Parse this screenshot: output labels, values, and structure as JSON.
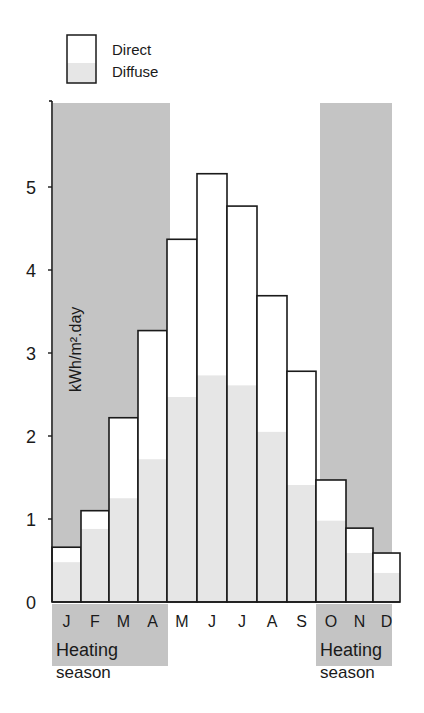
{
  "chart_data": {
    "type": "bar",
    "stacked": true,
    "title": "",
    "xlabel": "",
    "ylabel": "kWh/m².day",
    "ylim": [
      0,
      6
    ],
    "yticks": [
      0,
      1,
      2,
      3,
      4,
      5
    ],
    "grid": false,
    "legend_position": "top-left",
    "categories": [
      "J",
      "F",
      "M",
      "A",
      "M",
      "J",
      "J",
      "A",
      "S",
      "O",
      "N",
      "D"
    ],
    "series": [
      {
        "name": "Diffuse",
        "values": [
          0.48,
          0.88,
          1.25,
          1.72,
          2.47,
          2.73,
          2.61,
          2.05,
          1.41,
          0.98,
          0.59,
          0.35
        ]
      },
      {
        "name": "Direct",
        "values": [
          0.18,
          0.22,
          0.97,
          1.55,
          1.9,
          2.43,
          2.16,
          1.64,
          1.37,
          0.49,
          0.3,
          0.24
        ]
      }
    ],
    "totals": [
      0.66,
      1.1,
      2.22,
      3.27,
      4.37,
      5.16,
      4.77,
      3.69,
      2.78,
      1.47,
      0.89,
      0.59
    ],
    "annotations": [
      {
        "text": "Heating season",
        "span": [
          "J",
          "A"
        ]
      },
      {
        "text": "Heating season",
        "span": [
          "O",
          "D"
        ]
      }
    ]
  },
  "legend": {
    "direct_label": "Direct",
    "diffuse_label": "Diffuse"
  },
  "axis": {
    "ylabel": "kWh/m².day",
    "tick_labels": [
      "0",
      "1",
      "2",
      "3",
      "4",
      "5"
    ]
  },
  "months": [
    "J",
    "F",
    "M",
    "A",
    "M",
    "J",
    "J",
    "A",
    "S",
    "O",
    "N",
    "D"
  ],
  "heating_season": {
    "left": {
      "line1": "Heating",
      "line2": "season"
    },
    "right": {
      "line1": "Heating",
      "line2": "season"
    }
  },
  "colors": {
    "heating_shade": "#c4c4c4",
    "diffuse_fill": "#e6e6e6",
    "direct_fill": "#ffffff",
    "stroke": "#1a1a1a"
  }
}
